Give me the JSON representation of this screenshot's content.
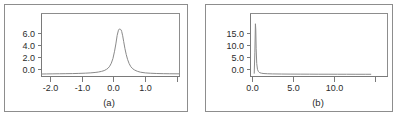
{
  "figure": {
    "background_color": "#ffffff",
    "frame_color": "#8d8d8d",
    "curve_color": "#8a8a8a",
    "text_color": "#2b2b2b"
  },
  "panels": [
    {
      "id": "a",
      "caption": "(a)",
      "y_ticks": [
        "0.0",
        "2.0",
        "4.0",
        "6.0"
      ],
      "x_ticks": [
        "-2.0",
        "-1.0",
        "0.0",
        "1.0"
      ]
    },
    {
      "id": "b",
      "caption": "(b)",
      "y_ticks": [
        "0.0",
        "5.0",
        "10.0",
        "15.0"
      ],
      "x_ticks": [
        "0.0",
        "5.0",
        "10.0"
      ]
    }
  ],
  "chart_data": [
    {
      "type": "line",
      "panel": "a",
      "title": "",
      "xlabel": "",
      "ylabel": "",
      "caption": "(a)",
      "xlim": [
        -2.35,
        1.9
      ],
      "ylim": [
        -0.25,
        7.1
      ],
      "xticks": [
        -2.0,
        -1.0,
        0.0,
        1.0
      ],
      "xticklabels": [
        "-2.0",
        "-1.0",
        "0.0",
        "1.0"
      ],
      "yticks": [
        0.0,
        2.0,
        4.0,
        6.0
      ],
      "yticklabels": [
        "0.0",
        "2.0",
        "4.0",
        "6.0"
      ],
      "grid": false,
      "legend": "none",
      "series": [
        {
          "name": "density",
          "x": [
            -2.35,
            -2.2,
            -2.0,
            -1.8,
            -1.6,
            -1.4,
            -1.2,
            -1.0,
            -0.85,
            -0.7,
            -0.6,
            -0.5,
            -0.42,
            -0.35,
            -0.3,
            -0.25,
            -0.2,
            -0.15,
            -0.1,
            -0.06,
            -0.02,
            0.02,
            0.05,
            0.08,
            0.1,
            0.12,
            0.15,
            0.18,
            0.22,
            0.26,
            0.3,
            0.35,
            0.4,
            0.46,
            0.52,
            0.6,
            0.7,
            0.85,
            1.0,
            1.2,
            1.4,
            1.6,
            1.9
          ],
          "y": [
            0.04,
            0.05,
            0.06,
            0.07,
            0.08,
            0.09,
            0.11,
            0.14,
            0.17,
            0.22,
            0.27,
            0.35,
            0.44,
            0.58,
            0.72,
            0.95,
            1.3,
            1.85,
            2.7,
            3.55,
            4.55,
            5.15,
            5.3,
            5.25,
            5.2,
            5.0,
            4.5,
            3.85,
            3.0,
            2.3,
            1.75,
            1.25,
            0.9,
            0.65,
            0.5,
            0.36,
            0.25,
            0.17,
            0.13,
            0.1,
            0.08,
            0.07,
            0.06
          ]
        }
      ]
    },
    {
      "type": "line",
      "panel": "b",
      "title": "",
      "xlabel": "",
      "ylabel": "",
      "caption": "(b)",
      "xlim": [
        -0.35,
        14.4
      ],
      "ylim": [
        -0.6,
        17.8
      ],
      "xticks": [
        0.0,
        5.0,
        10.0
      ],
      "xticklabels": [
        "0.0",
        "5.0",
        "10.0"
      ],
      "yticks": [
        0.0,
        5.0,
        10.0,
        15.0
      ],
      "yticklabels": [
        "0.0",
        "5.0",
        "10.0",
        "15.0"
      ],
      "grid": false,
      "legend": "none",
      "series": [
        {
          "name": "density",
          "x": [
            0.05,
            0.12,
            0.18,
            0.22,
            0.26,
            0.32,
            0.4,
            0.5,
            0.65,
            0.85,
            1.1,
            1.5,
            2.0,
            3.0,
            4.0,
            5.0,
            6.0,
            7.0,
            8.0,
            9.0,
            10.0,
            11.0,
            12.0,
            12.6
          ],
          "y": [
            0.35,
            6.5,
            14.8,
            13.0,
            7.5,
            3.2,
            1.5,
            0.85,
            0.5,
            0.35,
            0.26,
            0.2,
            0.16,
            0.12,
            0.1,
            0.09,
            0.08,
            0.07,
            0.07,
            0.06,
            0.06,
            0.05,
            0.05,
            0.05
          ]
        }
      ]
    }
  ]
}
